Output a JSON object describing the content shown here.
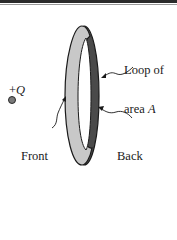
{
  "figure": {
    "charge": {
      "label_sign": "+",
      "label_var": "Q"
    },
    "loop_label": {
      "line1": "Loop of",
      "line2_text": "area ",
      "line2_var": "A"
    },
    "front_label": {
      "line1": "Front",
      "line2": "of",
      "line3": "loop"
    },
    "back_label": {
      "line1": "Back",
      "line2": "of",
      "line3": "loop"
    },
    "colors": {
      "front_face": "#c8c8c8",
      "back_face": "#4a4a4a",
      "outline": "#1a1a1a",
      "charge_fill": "#7a7a7a"
    }
  }
}
